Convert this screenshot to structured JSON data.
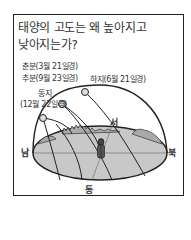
{
  "title": {
    "line1": "태양의 고도는 왜 높아지고",
    "line2": "낮아지는가?"
  },
  "labels": {
    "equinox_spring": "춘분(3월 21일경)",
    "equinox_autumn": "추분(9월 23일경)",
    "summer_solstice": "하지(6월 21일경)",
    "winter_solstice_name": "동지",
    "winter_solstice_date": "(12월 22일경)"
  },
  "directions": {
    "south": "남",
    "north": "북",
    "east": "동",
    "west": "서"
  },
  "colors": {
    "ground": "#c8c8c8",
    "line": "#222222",
    "frame": "#222222"
  }
}
